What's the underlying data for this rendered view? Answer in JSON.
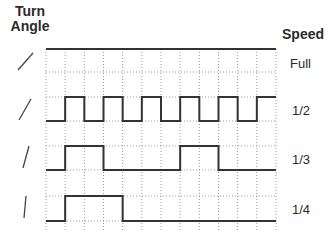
{
  "header": {
    "left_title_line1": "Turn",
    "left_title_line2": "Angle",
    "right_title": "Speed"
  },
  "rows": [
    {
      "speed": "Full",
      "angle_icon": "slash-line-shallow"
    },
    {
      "speed": "1/2",
      "angle_icon": "slash-line-medium"
    },
    {
      "speed": "1/3",
      "angle_icon": "slash-line-steep"
    },
    {
      "speed": "1/4",
      "angle_icon": "slash-line-near-vertical"
    }
  ],
  "chart_data": {
    "type": "line",
    "xlabel": "",
    "ylabel": "",
    "grid": true,
    "x_divisions": 12,
    "series": [
      {
        "name": "Full",
        "values": [
          1,
          1,
          1,
          1,
          1,
          1,
          1,
          1,
          1,
          1,
          1,
          1
        ]
      },
      {
        "name": "1/2",
        "values": [
          0,
          1,
          0,
          1,
          0,
          1,
          0,
          1,
          0,
          1,
          0,
          1
        ]
      },
      {
        "name": "1/3",
        "values": [
          0,
          1,
          1,
          0,
          0,
          0,
          0,
          1,
          1,
          0,
          0,
          0
        ]
      },
      {
        "name": "1/4",
        "values": [
          0,
          1,
          1,
          1,
          0,
          0,
          0,
          0,
          0,
          0,
          0,
          0
        ]
      }
    ]
  }
}
